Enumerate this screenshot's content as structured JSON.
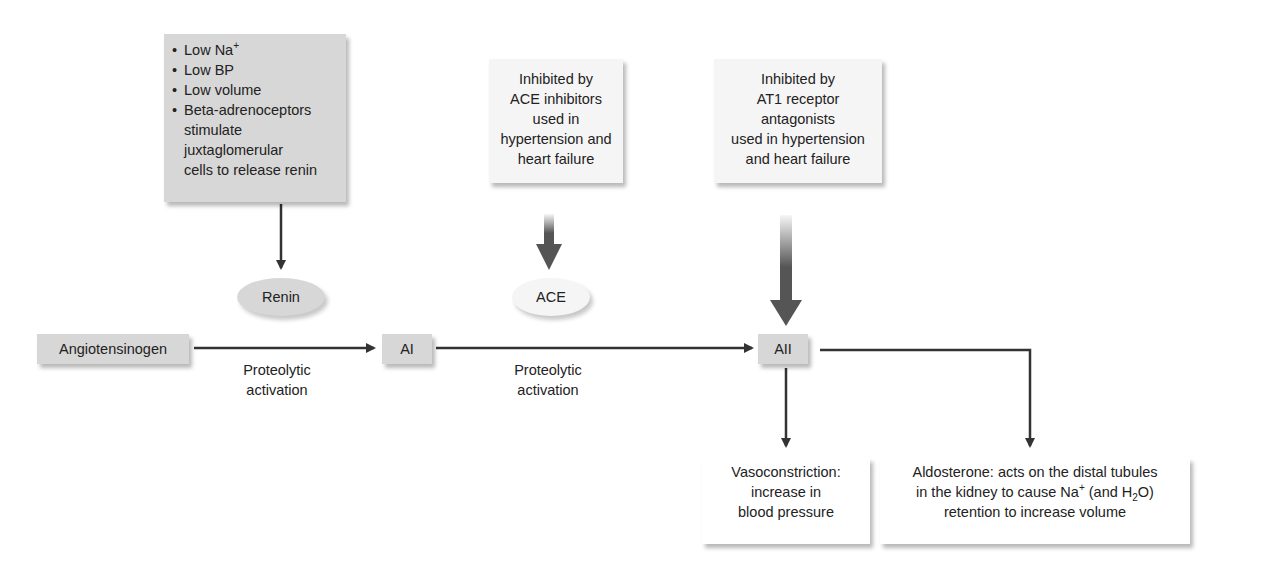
{
  "stimuli_box": {
    "items": [
      {
        "text": "Low Na",
        "sup": "+"
      },
      {
        "text": "Low BP"
      },
      {
        "text": "Low volume"
      },
      {
        "text": "Beta-adrenoceptors"
      }
    ],
    "continuation": [
      "stimulate juxtaglomerular",
      "cells to release renin"
    ]
  },
  "ace_inhibitor_box": {
    "lines": [
      "Inhibited by",
      "ACE inhibitors",
      "used in",
      "hypertension and",
      "heart failure"
    ]
  },
  "at1_box": {
    "lines": [
      "Inhibited by",
      "AT1 receptor",
      "antagonists",
      "used in hypertension",
      "and heart failure"
    ]
  },
  "enzymes": {
    "renin": "Renin",
    "ace": "ACE"
  },
  "pathway": {
    "angiotensinogen": "Angiotensinogen",
    "ai": "AI",
    "aii": "AII",
    "step1_label": [
      "Proteolytic",
      "activation"
    ],
    "step2_label": [
      "Proteolytic",
      "activation"
    ]
  },
  "effects": {
    "vasoconstriction": [
      "Vasoconstriction:",
      "increase in",
      "blood pressure"
    ],
    "aldosterone": {
      "line1": "Aldosterone: acts on the distal tubules",
      "line2_a": "in the kidney to cause Na",
      "line2_sup": "+",
      "line2_b": " (and H",
      "line2_sub": "2",
      "line2_c": "O)",
      "line3": "retention to increase volume"
    }
  },
  "colors": {
    "grey_box": "#d7d7d7",
    "light_box": "#f5f5f5",
    "arrow": "#333333",
    "thick_arrow": "#555555"
  }
}
